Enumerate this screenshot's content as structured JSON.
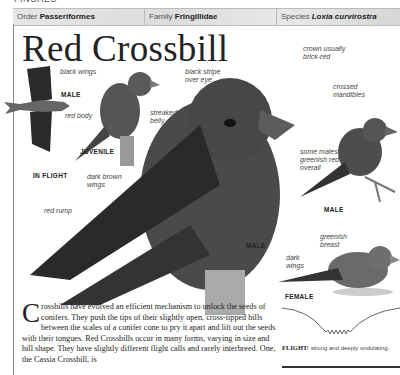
{
  "header": {
    "top_cut_text": "FINCHES",
    "order_label": "Order",
    "order_value": "Passeriformes",
    "family_label": "Family",
    "family_value": "Fringillidae",
    "species_label": "Species",
    "species_value": "Loxia curvirostra"
  },
  "title": "Red Crossbill",
  "labels": {
    "black_wings": "black wings",
    "male_flight": "MALE",
    "red_body": "red body",
    "in_flight": "IN FLIGHT",
    "streaked_belly_1": "streaked",
    "streaked_belly_2": "belly",
    "juvenile": "JUVENILE",
    "black_stripe_1": "black stripe",
    "black_stripe_2": "over eye",
    "crown_1": "crown usually",
    "crown_2": "brick-red",
    "crossed_1": "crossed",
    "crossed_2": "mandibles",
    "dark_brown_1": "dark brown",
    "dark_brown_2": "wings",
    "red_rump": "red rump",
    "male_main": "MALE",
    "some_males_1": "some males",
    "some_males_2": "greenish red",
    "some_males_3": "overall",
    "male_right": "MALE",
    "greenish_1": "greenish",
    "greenish_2": "breast",
    "dark_wings_1": "dark",
    "dark_wings_2": "wings",
    "female": "FEMALE"
  },
  "flight": {
    "label": "FLIGHT:",
    "description": "strong and deeply undulating."
  },
  "body": {
    "dropcap": "C",
    "text": "rossbills have evolved an efficient mechanism to unlock the seeds of conifers. They push the tips of their slightly open, cross-tipped bills between the scales of a conifer cone to pry it apart and lift out the seeds with their tongues. Red Crossbills occur in many forms, varying in size and bill shape. They have slightly different flight calls and rarely interbreed. One, the Cassia Crossbill, is"
  }
}
